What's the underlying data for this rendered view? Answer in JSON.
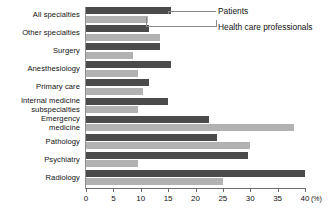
{
  "chart_data": {
    "type": "bar",
    "orientation": "horizontal",
    "title": "",
    "xlabel": "(%)",
    "ylabel": "",
    "xlim": [
      0,
      40
    ],
    "xticks": [
      0,
      5,
      10,
      15,
      20,
      25,
      30,
      35,
      40
    ],
    "xtick_labels": [
      "0",
      "5",
      "10",
      "15",
      "20",
      "25",
      "30",
      "35",
      "40"
    ],
    "unit_label": "(%)",
    "grid": false,
    "legend_position": "inside-top-right-callout",
    "categories": [
      "All specialties",
      "Other specialties",
      "Surgery",
      "Anesthesiology",
      "Primary care",
      "Internal medicine\nsubspecialties",
      "Emergency\nmedicine",
      "Pathology",
      "Psychiatry",
      "Radiology"
    ],
    "series": [
      {
        "name": "Patients",
        "color": "#4b4b4b",
        "values": [
          15.5,
          11.5,
          13.5,
          15.5,
          11.5,
          15.0,
          22.5,
          24.0,
          29.5,
          40.0
        ]
      },
      {
        "name": "Health care professionals",
        "color": "#b2b2b2",
        "values": [
          11.3,
          13.5,
          8.5,
          9.5,
          10.5,
          9.5,
          38.0,
          30.0,
          9.5,
          25.0
        ]
      }
    ]
  },
  "legend": {
    "patients_label": "Patients",
    "professionals_label": "Health care professionals"
  }
}
